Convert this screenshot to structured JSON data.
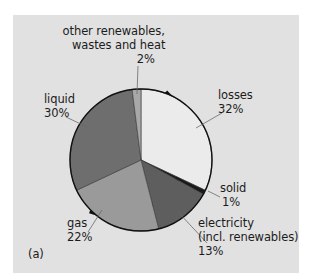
{
  "chart_data": {
    "type": "pie",
    "title": "",
    "panel_label": "(a)",
    "start_angle_deg": 0,
    "direction": "clockwise",
    "slices": [
      {
        "name": "losses",
        "label_lines": [
          "losses",
          "32%"
        ],
        "value": 32,
        "color": "#ebebeb"
      },
      {
        "name": "solid",
        "label_lines": [
          "solid",
          "1%"
        ],
        "value": 1,
        "color": "#1a1a1a"
      },
      {
        "name": "electricity (incl. renewables)",
        "label_lines": [
          "electricity",
          "(incl. renewables)",
          "13%"
        ],
        "value": 13,
        "color": "#5e5e5e"
      },
      {
        "name": "gas",
        "label_lines": [
          "gas",
          "22%"
        ],
        "value": 22,
        "color": "#9a9a9a"
      },
      {
        "name": "liquid",
        "label_lines": [
          "liquid",
          "30%"
        ],
        "value": 30,
        "color": "#6e6e6e"
      },
      {
        "name": "other renewables, wastes and heat",
        "label_lines": [
          "other renewables,",
          "wastes and heat",
          "2%"
        ],
        "value": 2,
        "color": "#a8a8a8"
      }
    ],
    "legend": "none (direct labels with leader lines)"
  },
  "labels": {
    "other": {
      "l1": "other renewables,",
      "l2": "wastes and heat",
      "l3": "2%"
    },
    "losses": {
      "l1": "losses",
      "l2": "32%"
    },
    "liquid": {
      "l1": "liquid",
      "l2": "30%"
    },
    "solid": {
      "l1": "solid",
      "l2": "1%"
    },
    "electricity": {
      "l1": "electricity",
      "l2": "(incl. renewables)",
      "l3": "13%"
    },
    "gas": {
      "l1": "gas",
      "l2": "22%"
    },
    "panel": "(a)"
  },
  "colors": {
    "background": "#e1e1e1",
    "outline": "#111111"
  }
}
